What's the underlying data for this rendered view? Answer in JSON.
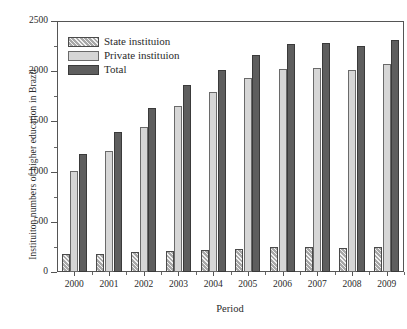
{
  "chart_data": {
    "type": "bar",
    "title": "",
    "xlabel": "Period",
    "ylabel": "Instituiton numbers of higher education in Brazil",
    "categories": [
      "2000",
      "2001",
      "2002",
      "2003",
      "2004",
      "2005",
      "2006",
      "2007",
      "2008",
      "2009"
    ],
    "series": [
      {
        "name": "State instituion",
        "values": [
          176,
          183,
          195,
          207,
          224,
          231,
          248,
          249,
          236,
          245
        ]
      },
      {
        "name": "Private instituion",
        "values": [
          1004,
          1208,
          1442,
          1652,
          1789,
          1934,
          2022,
          2032,
          2016,
          2069
        ]
      },
      {
        "name": "Total",
        "values": [
          1180,
          1391,
          1637,
          1859,
          2013,
          2165,
          2270,
          2281,
          2252,
          2314
        ]
      }
    ],
    "ylim": [
      0,
      2500
    ],
    "yticks": [
      0,
      500,
      1000,
      1500,
      2000,
      2500
    ],
    "ytick_labels": [
      "0",
      "500",
      "1000",
      "1500",
      "2000",
      "2500"
    ],
    "y_minor_interval": 250,
    "grid": false,
    "legend_position": "upper-left",
    "colors": {
      "state": "#a8a8a8",
      "private": "#d6d6d6",
      "total": "#5e5e5e",
      "axis": "#555555",
      "text": "#2b2b2b"
    }
  },
  "legend": {
    "items": [
      {
        "label": "State instituion",
        "swatch": "hatch-swatch-icon"
      },
      {
        "label": "Private instituion",
        "swatch": "light-gray-swatch-icon"
      },
      {
        "label": "Total",
        "swatch": "dark-gray-swatch-icon"
      }
    ]
  }
}
